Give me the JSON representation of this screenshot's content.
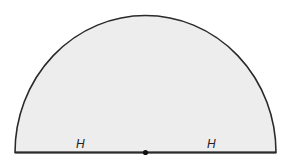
{
  "diagram": {
    "shape": "semicircle",
    "fill": "#ededed",
    "stroke": "#2a2a2a",
    "labels": {
      "left_radius": "H",
      "right_radius": "H"
    },
    "center_point": "filled-dot"
  }
}
